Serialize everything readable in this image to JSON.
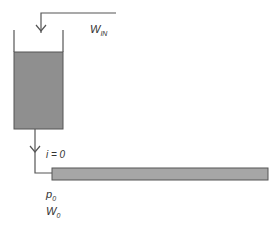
{
  "diagram": {
    "type": "tank-discharge-pipe",
    "labels": {
      "inflow": {
        "symbol": "W",
        "subscript": "IN"
      },
      "outlet_condition": "i = 0",
      "pressure": {
        "symbol": "p",
        "subscript": "0"
      },
      "flow": {
        "symbol": "W",
        "subscript": "0"
      }
    },
    "colors": {
      "line": "#555555",
      "liquid": "#8f8f8f",
      "pipe": "#a6a6a6",
      "background": "#ffffff"
    }
  }
}
